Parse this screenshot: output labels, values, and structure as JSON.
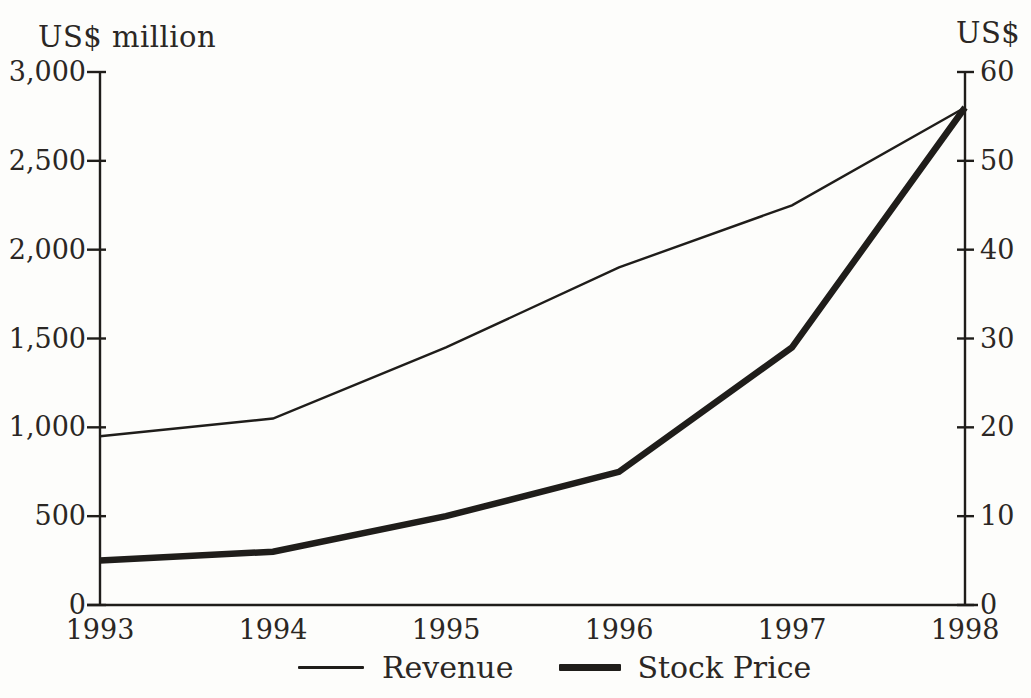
{
  "chart_data": {
    "type": "line",
    "title": "",
    "x": [
      1993,
      1994,
      1995,
      1996,
      1997,
      1998
    ],
    "x_tick_labels": [
      "1993",
      "1994",
      "1995",
      "1996",
      "1997",
      "1998"
    ],
    "series": [
      {
        "name": "Revenue",
        "axis": "left",
        "values": [
          950,
          1050,
          1450,
          1900,
          2250,
          2800
        ],
        "stroke_width": 2.4
      },
      {
        "name": "Stock Price",
        "axis": "right",
        "values": [
          5,
          6,
          10,
          15,
          29,
          56
        ],
        "stroke_width": 6.5
      }
    ],
    "left_axis": {
      "label": "US$ million",
      "min": 0,
      "max": 3000,
      "tick_labels": [
        "3,000",
        "2,500",
        "2,000",
        "1,500",
        "1,000",
        "500",
        "0"
      ],
      "tick_values": [
        3000,
        2500,
        2000,
        1500,
        1000,
        500,
        0
      ]
    },
    "right_axis": {
      "label": "US$",
      "min": 0,
      "max": 60,
      "tick_labels": [
        "60",
        "50",
        "40",
        "30",
        "20",
        "10",
        "0"
      ],
      "tick_values": [
        60,
        50,
        40,
        30,
        20,
        10,
        0
      ]
    },
    "grid": false,
    "legend_position": "bottom",
    "line_color": "#1f1d1a",
    "text_color": "#2b2724",
    "background_color": "#fdfdfb"
  },
  "legend": {
    "items": [
      {
        "label": "Revenue",
        "style": "thin-line"
      },
      {
        "label": "Stock Price",
        "style": "thick-line"
      }
    ]
  }
}
